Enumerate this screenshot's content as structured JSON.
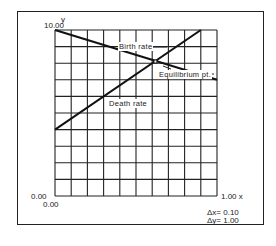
{
  "chart_data": {
    "type": "line",
    "title": "",
    "xlabel": "x",
    "ylabel": "y",
    "xlim": [
      0.0,
      1.0
    ],
    "ylim": [
      0.0,
      10.0
    ],
    "grid": true,
    "grid_step": {
      "x": 0.1,
      "y": 1.0
    },
    "series": [
      {
        "name": "Birth rate",
        "x": [
          0.0,
          1.0
        ],
        "y": [
          10.0,
          7.0
        ]
      },
      {
        "name": "Death rate",
        "x": [
          0.0,
          0.9
        ],
        "y": [
          4.0,
          10.0
        ]
      }
    ],
    "annotations": [
      {
        "text": "Birth rate",
        "target": "Birth rate line"
      },
      {
        "text": "Death rate",
        "target": "Death rate line"
      },
      {
        "text": "Equilibrium pt.",
        "x": 0.62,
        "y": 8.1
      }
    ]
  },
  "axes": {
    "y_label": "y",
    "y_max_label": "10.00",
    "y_min_label": "0.00",
    "x_min_label": "0.00",
    "x_max_label": "1.00 x"
  },
  "labels": {
    "birth_rate": "Birth rate",
    "death_rate": "Death rate",
    "equilibrium": "Equilibrium pt."
  },
  "scale": {
    "dx": "Δx= 0.10",
    "dy": "Δy= 1.00"
  }
}
